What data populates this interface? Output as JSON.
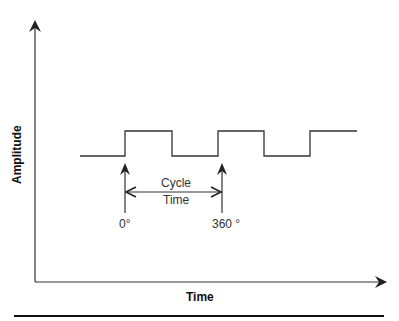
{
  "diagram": {
    "type": "square-wave-timing",
    "x_axis_label": "Time",
    "y_axis_label": "Amplitude",
    "annotations": {
      "cycle_label_line1": "Cycle",
      "cycle_label_line2": "Time",
      "start_marker": "0°",
      "end_marker": "360 °"
    },
    "waveform": {
      "low_y": 156,
      "high_y": 131,
      "transitions_x": [
        80,
        125,
        172,
        218,
        264,
        310,
        357
      ]
    },
    "colors": {
      "line": "#333333",
      "rule": "#111111"
    }
  }
}
